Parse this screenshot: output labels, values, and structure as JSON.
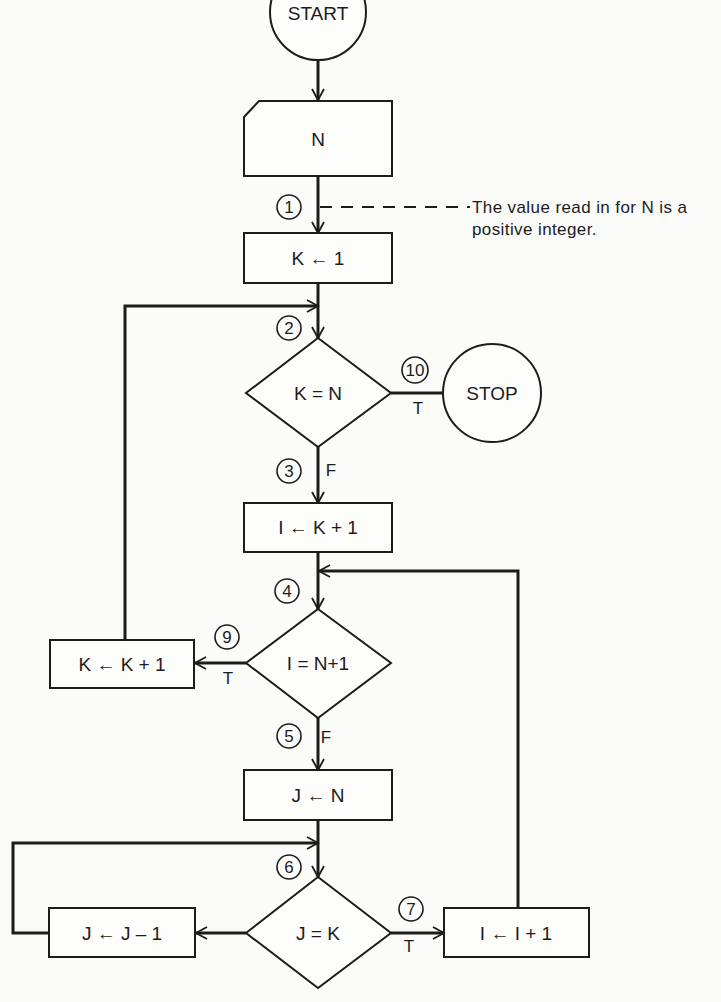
{
  "flowchart": {
    "terminals": {
      "start": "START",
      "stop": "STOP"
    },
    "input": {
      "label": "N"
    },
    "annotation": {
      "line1": "The value read in for N is a",
      "line2": "positive integer."
    },
    "processes": {
      "k_init": "K ← 1",
      "i_init": "I ← K + 1",
      "k_inc": "K ← K + 1",
      "j_init": "J ← N",
      "j_dec": "J ← J – 1",
      "i_inc": "I ← I + 1"
    },
    "decisions": {
      "k_eq_n": "K = N",
      "i_eq_n1": "I = N+1",
      "j_eq_k": "J = K"
    },
    "branch_labels": {
      "k_eq_n_true": "T",
      "k_eq_n_false": "F",
      "i_eq_n1_true": "T",
      "i_eq_n1_false": "F",
      "j_eq_k_true": "T"
    },
    "connectors": {
      "c1": "1",
      "c2": "2",
      "c3": "3",
      "c4": "4",
      "c5": "5",
      "c6": "6",
      "c7": "7",
      "c9": "9",
      "c10": "10"
    },
    "colors": {
      "ink": "#1c1c1c",
      "paper": "#fbfbf9"
    }
  }
}
